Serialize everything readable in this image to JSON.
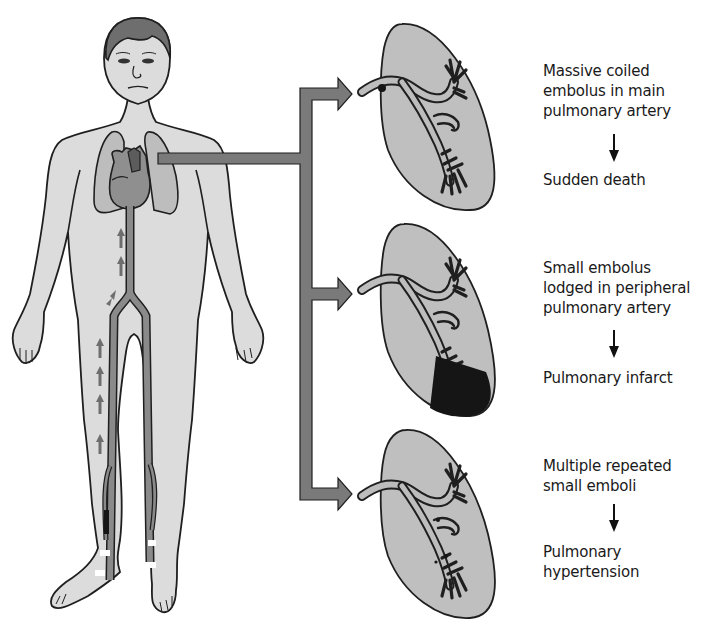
{
  "figure": {
    "colors": {
      "skin": "#dcdcdc",
      "outline": "#1f1f1f",
      "lung_body": "#bdbdbd",
      "lung_panel": "#bfbfbf",
      "heart": "#8f8f8f",
      "vein": "#8a8a8a",
      "connector": "#7a7a7a",
      "infarct": "#151515",
      "background": "#ffffff"
    }
  },
  "panels": [
    {
      "id": "massive",
      "cause": [
        "Massive coiled",
        "embolus in main",
        "pulmonary artery"
      ],
      "arrow": "down-arrow",
      "outcome": [
        "Sudden death"
      ]
    },
    {
      "id": "small",
      "cause": [
        "Small embolus",
        "lodged in peripheral",
        "pulmonary artery"
      ],
      "arrow": "down-arrow",
      "outcome": [
        "Pulmonary infarct"
      ]
    },
    {
      "id": "multiple",
      "cause": [
        "Multiple repeated",
        "small emboli"
      ],
      "arrow": "down-arrow",
      "outcome": [
        "Pulmonary",
        "hypertension"
      ]
    }
  ]
}
